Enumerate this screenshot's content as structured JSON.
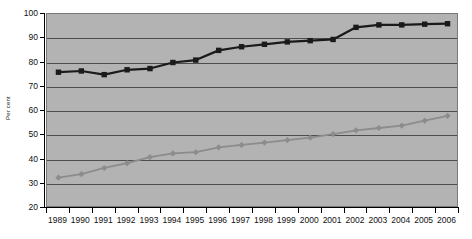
{
  "chart_data": {
    "type": "line",
    "title": "",
    "xlabel": "",
    "ylabel": "Per cent",
    "ylim": [
      20,
      100
    ],
    "ytick_step": 10,
    "yticks": [
      20,
      30,
      40,
      50,
      60,
      70,
      80,
      90,
      100
    ],
    "grid": true,
    "legend": "none",
    "categories": [
      "1989",
      "1990",
      "1991",
      "1992",
      "1993",
      "1994",
      "1995",
      "1996",
      "1997",
      "1998",
      "1999",
      "2000",
      "2001",
      "2002",
      "2003",
      "2004",
      "2005",
      "2006"
    ],
    "series": [
      {
        "name": "upper-series",
        "marker": "square",
        "color": "#1a1a1a",
        "values": [
          76,
          76.5,
          75,
          77,
          77.5,
          80,
          81,
          85,
          86.5,
          87.5,
          88.5,
          89,
          89.5,
          94.5,
          95.5,
          95.5,
          95.8,
          96
        ]
      },
      {
        "name": "lower-series",
        "marker": "diamond",
        "color": "#8c8c8c",
        "values": [
          32.5,
          34,
          36.5,
          38.5,
          41,
          42.5,
          43,
          45,
          46,
          47,
          48,
          49,
          50.5,
          52,
          53,
          54,
          56,
          58
        ]
      }
    ],
    "colors": {
      "plot_background": "#b3b3b3",
      "gridline": "#4d4d4d",
      "axis": "#000000",
      "page_background": "#ffffff"
    }
  }
}
